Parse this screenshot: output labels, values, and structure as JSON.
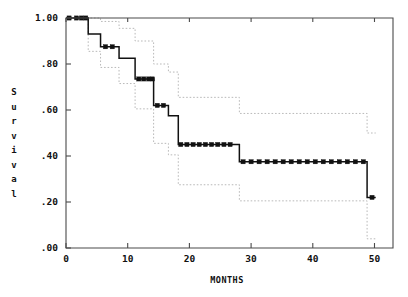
{
  "chart_data": {
    "type": "line",
    "title": "",
    "subtitle": "",
    "xlabel": "MONTHS",
    "ylabel": "Survival",
    "ylabel_letters": [
      "S",
      "u",
      "r",
      "v",
      "i",
      "v",
      "a",
      "l"
    ],
    "xlim": [
      0,
      53
    ],
    "ylim": [
      0.0,
      1.0
    ],
    "xticks": [
      0,
      10,
      20,
      30,
      40,
      50
    ],
    "xticklabels": [
      "0",
      "10",
      "20",
      "30",
      "40",
      "50"
    ],
    "yticks": [
      0.0,
      0.2,
      0.4,
      0.6,
      0.8,
      1.0
    ],
    "yticklabels": [
      ".00",
      ".20",
      ".40",
      ".60",
      ".80",
      "1.00"
    ],
    "grid": false,
    "legend": "none",
    "curve_color": "#111111",
    "ci_color": "#b9b9b9",
    "frame_color": "#4a4a4a",
    "series": [
      {
        "name": "Kaplan-Meier survival estimate",
        "style": "step",
        "points": [
          {
            "t": 0.0,
            "s": 1.0
          },
          {
            "t": 3.6,
            "s": 1.0
          },
          {
            "t": 3.6,
            "s": 0.93
          },
          {
            "t": 5.6,
            "s": 0.93
          },
          {
            "t": 5.6,
            "s": 0.875
          },
          {
            "t": 8.6,
            "s": 0.875
          },
          {
            "t": 8.6,
            "s": 0.825
          },
          {
            "t": 11.2,
            "s": 0.825
          },
          {
            "t": 11.2,
            "s": 0.735
          },
          {
            "t": 14.2,
            "s": 0.735
          },
          {
            "t": 14.2,
            "s": 0.62
          },
          {
            "t": 16.6,
            "s": 0.62
          },
          {
            "t": 16.6,
            "s": 0.575
          },
          {
            "t": 18.2,
            "s": 0.575
          },
          {
            "t": 18.2,
            "s": 0.45
          },
          {
            "t": 28.1,
            "s": 0.45
          },
          {
            "t": 28.1,
            "s": 0.375
          },
          {
            "t": 48.8,
            "s": 0.375
          },
          {
            "t": 48.8,
            "s": 0.22
          },
          {
            "t": 50.2,
            "s": 0.22
          }
        ],
        "censored": [
          {
            "t": 0.5,
            "s": 1.0
          },
          {
            "t": 1.7,
            "s": 1.0
          },
          {
            "t": 2.5,
            "s": 1.0
          },
          {
            "t": 3.2,
            "s": 1.0
          },
          {
            "t": 6.4,
            "s": 0.875
          },
          {
            "t": 7.5,
            "s": 0.875
          },
          {
            "t": 11.8,
            "s": 0.735
          },
          {
            "t": 12.6,
            "s": 0.735
          },
          {
            "t": 13.4,
            "s": 0.735
          },
          {
            "t": 14.0,
            "s": 0.735
          },
          {
            "t": 14.8,
            "s": 0.62
          },
          {
            "t": 15.8,
            "s": 0.62
          },
          {
            "t": 18.6,
            "s": 0.45
          },
          {
            "t": 19.6,
            "s": 0.45
          },
          {
            "t": 20.6,
            "s": 0.45
          },
          {
            "t": 21.6,
            "s": 0.45
          },
          {
            "t": 22.6,
            "s": 0.45
          },
          {
            "t": 23.6,
            "s": 0.45
          },
          {
            "t": 24.6,
            "s": 0.45
          },
          {
            "t": 25.6,
            "s": 0.45
          },
          {
            "t": 26.6,
            "s": 0.45
          },
          {
            "t": 28.7,
            "s": 0.375
          },
          {
            "t": 30.0,
            "s": 0.375
          },
          {
            "t": 31.3,
            "s": 0.375
          },
          {
            "t": 32.6,
            "s": 0.375
          },
          {
            "t": 33.9,
            "s": 0.375
          },
          {
            "t": 35.2,
            "s": 0.375
          },
          {
            "t": 36.5,
            "s": 0.375
          },
          {
            "t": 37.8,
            "s": 0.375
          },
          {
            "t": 39.1,
            "s": 0.375
          },
          {
            "t": 40.4,
            "s": 0.375
          },
          {
            "t": 41.7,
            "s": 0.375
          },
          {
            "t": 43.0,
            "s": 0.375
          },
          {
            "t": 44.3,
            "s": 0.375
          },
          {
            "t": 45.6,
            "s": 0.375
          },
          {
            "t": 46.9,
            "s": 0.375
          },
          {
            "t": 48.2,
            "s": 0.375
          },
          {
            "t": 49.6,
            "s": 0.22
          }
        ]
      },
      {
        "name": "upper 95% confidence band",
        "style": "step-dotted",
        "points": [
          {
            "t": 0.0,
            "s": 1.0
          },
          {
            "t": 5.6,
            "s": 1.0
          },
          {
            "t": 5.6,
            "s": 0.985
          },
          {
            "t": 8.6,
            "s": 0.985
          },
          {
            "t": 8.6,
            "s": 0.955
          },
          {
            "t": 11.2,
            "s": 0.955
          },
          {
            "t": 11.2,
            "s": 0.9
          },
          {
            "t": 14.2,
            "s": 0.9
          },
          {
            "t": 14.2,
            "s": 0.8
          },
          {
            "t": 16.6,
            "s": 0.8
          },
          {
            "t": 16.6,
            "s": 0.765
          },
          {
            "t": 18.2,
            "s": 0.765
          },
          {
            "t": 18.2,
            "s": 0.655
          },
          {
            "t": 28.1,
            "s": 0.655
          },
          {
            "t": 28.1,
            "s": 0.585
          },
          {
            "t": 48.8,
            "s": 0.585
          },
          {
            "t": 48.8,
            "s": 0.5
          },
          {
            "t": 50.2,
            "s": 0.5
          }
        ]
      },
      {
        "name": "lower 95% confidence band",
        "style": "step-dotted",
        "points": [
          {
            "t": 0.0,
            "s": 1.0
          },
          {
            "t": 3.6,
            "s": 1.0
          },
          {
            "t": 3.6,
            "s": 0.855
          },
          {
            "t": 5.6,
            "s": 0.855
          },
          {
            "t": 5.6,
            "s": 0.785
          },
          {
            "t": 8.6,
            "s": 0.785
          },
          {
            "t": 8.6,
            "s": 0.715
          },
          {
            "t": 11.2,
            "s": 0.715
          },
          {
            "t": 11.2,
            "s": 0.605
          },
          {
            "t": 14.2,
            "s": 0.605
          },
          {
            "t": 14.2,
            "s": 0.455
          },
          {
            "t": 16.6,
            "s": 0.455
          },
          {
            "t": 16.6,
            "s": 0.405
          },
          {
            "t": 18.2,
            "s": 0.405
          },
          {
            "t": 18.2,
            "s": 0.275
          },
          {
            "t": 28.1,
            "s": 0.275
          },
          {
            "t": 28.1,
            "s": 0.205
          },
          {
            "t": 48.8,
            "s": 0.205
          },
          {
            "t": 48.8,
            "s": 0.04
          },
          {
            "t": 50.2,
            "s": 0.04
          }
        ]
      }
    ]
  }
}
